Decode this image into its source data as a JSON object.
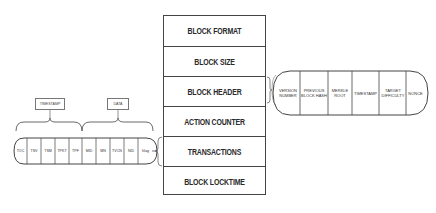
{
  "block_structure": {
    "rows": [
      {
        "label": "BLOCK FORMAT"
      },
      {
        "label": "BLOCK SIZE"
      },
      {
        "label": "BLOCK HEADER"
      },
      {
        "label": "ACTION COUNTER"
      },
      {
        "label": "TRANSACTIONS"
      },
      {
        "label": "BLOCK LOCKTIME"
      }
    ]
  },
  "block_header_fields": [
    {
      "label": "VERSION NUMBER"
    },
    {
      "label": "PREVIOUS BLOCK HASH"
    },
    {
      "label": "MERKLE ROOT"
    },
    {
      "label": "TIMESTAMP"
    },
    {
      "label": "TARGET DIFFICULTY"
    },
    {
      "label": "NONCE"
    }
  ],
  "transaction_fields": [
    {
      "label": "TOC"
    },
    {
      "label": "TSV"
    },
    {
      "label": "TSM"
    },
    {
      "label": "TPKT"
    },
    {
      "label": "TPF"
    },
    {
      "label": "MID"
    },
    {
      "label": "MN"
    },
    {
      "label": "TVCN"
    },
    {
      "label": "NID"
    },
    {
      "label": "hlag"
    }
  ],
  "transaction_groups": [
    {
      "label": "TIMESTAMP"
    },
    {
      "label": "DATA"
    }
  ],
  "colors": {
    "line": "#444444",
    "text": "#2a2a2a",
    "background": "#ffffff"
  }
}
